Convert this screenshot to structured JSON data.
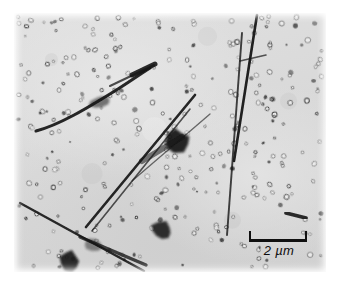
{
  "figure": {
    "kind": "electron-micrograph",
    "background_color": "#d9d9d9",
    "feature_color": "#141414",
    "plate": {
      "x": 14,
      "y": 13,
      "width": 312,
      "height": 259
    }
  },
  "scalebar": {
    "value": "2",
    "unit": "µm",
    "label": "2 µm",
    "bar_length_px": 58,
    "color": "#101010",
    "position": "bottom-right"
  },
  "features": {
    "needles": [
      {
        "name": "upper-left-curved-needle",
        "d": "M 22 118 C 45 112, 72 96, 104 76 C 118 67, 128 60, 136 55",
        "width": 3.1,
        "opacity": 0.92
      },
      {
        "name": "upper-left-needle-tip",
        "d": "M 96 73 L 140 52",
        "width": 2.0,
        "opacity": 0.75
      },
      {
        "name": "upper-left-needle-blade",
        "d": "M 118 62 L 141 51",
        "width": 5.0,
        "opacity": 0.9
      },
      {
        "name": "right-vertical-needle-a",
        "d": "M 243 2 L 220 148",
        "width": 2.6,
        "opacity": 0.95
      },
      {
        "name": "right-vertical-needle-b",
        "d": "M 228 20 L 213 222",
        "width": 1.9,
        "opacity": 0.8
      },
      {
        "name": "right-needle-branch",
        "d": "M 226 48 L 252 42",
        "width": 1.6,
        "opacity": 0.7
      },
      {
        "name": "center-long-needle",
        "d": "M 72 214 L 181 82",
        "width": 2.6,
        "opacity": 0.92
      },
      {
        "name": "center-long-needle-2",
        "d": "M 78 218 L 176 96",
        "width": 1.6,
        "opacity": 0.72
      },
      {
        "name": "center-thin-needle",
        "d": "M 118 168 L 196 101",
        "width": 1.3,
        "opacity": 0.6
      },
      {
        "name": "center-blade",
        "d": "M 128 148 L 168 124",
        "width": 6.0,
        "opacity": 0.55
      },
      {
        "name": "lower-left-long-needle",
        "d": "M 6 190 L 130 258",
        "width": 2.4,
        "opacity": 0.9
      },
      {
        "name": "lower-left-needle-2",
        "d": "M 66 224 L 132 252",
        "width": 3.4,
        "opacity": 0.78
      },
      {
        "name": "short-right-rod",
        "d": "M 272 200 L 292 205",
        "width": 3.6,
        "opacity": 0.9
      }
    ],
    "blobs": [
      {
        "name": "central-dark-particle",
        "cx": 163,
        "cy": 128,
        "rx": 13,
        "ry": 11,
        "rot": -20,
        "opacity": 0.93
      },
      {
        "name": "lower-center-dark-particle",
        "cx": 148,
        "cy": 218,
        "rx": 11,
        "ry": 9,
        "rot": 12,
        "opacity": 0.88
      },
      {
        "name": "lower-left-dark-particle",
        "cx": 56,
        "cy": 248,
        "rx": 10,
        "ry": 11,
        "rot": 0,
        "opacity": 0.9
      },
      {
        "name": "upper-left-gray-particle",
        "cx": 86,
        "cy": 89,
        "rx": 11,
        "ry": 6,
        "rot": -8,
        "opacity": 0.55
      },
      {
        "name": "mid-left-gray-particle",
        "cx": 78,
        "cy": 232,
        "rx": 9,
        "ry": 6,
        "rot": 15,
        "opacity": 0.45
      }
    ],
    "particle_count": 320,
    "particle_style": "ring"
  }
}
